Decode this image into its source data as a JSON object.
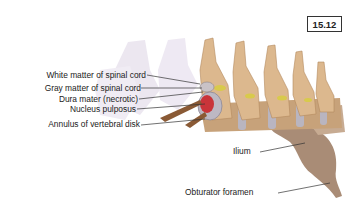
{
  "figure": {
    "number": "15.12"
  },
  "labels": {
    "white_matter": "White matter of spinal cord",
    "gray_matter": "Gray matter of spinal cord",
    "dura_mater": "Dura mater (necrotic)",
    "nucleus_pulposus": "Nucleus pulposus",
    "annulus": "Annulus of vertebral disk",
    "ilium": "Ilium",
    "obturator_foramen": "Obturator foramen"
  },
  "colors": {
    "bone": "#d9b48a",
    "bone_shadow": "#b98d62",
    "ghost_bone": "#e4dcea",
    "disk": "#b8b4bc",
    "nucleus": "#c9343a",
    "nerve": "#d6c84a",
    "pelvis": "#a88a73",
    "leader": "#333333"
  }
}
